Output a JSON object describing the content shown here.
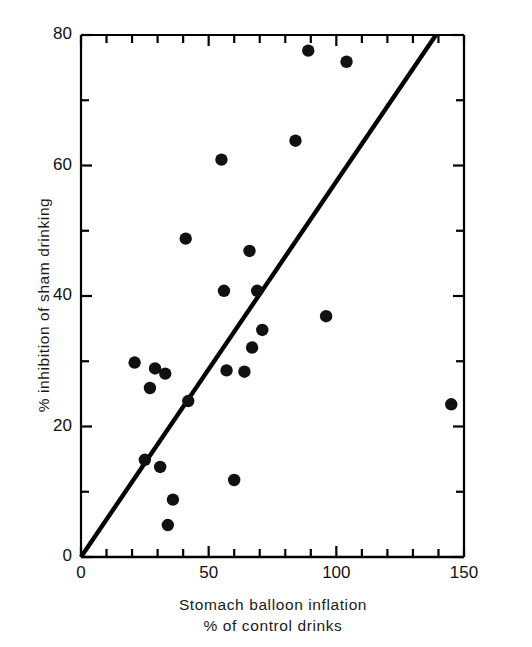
{
  "chart_data": {
    "type": "scatter",
    "title": "",
    "xlabel": "Stomach balloon inflation\n% of control drinks",
    "xlabel_line1": "Stomach balloon inflation",
    "xlabel_line2": "% of control drinks",
    "ylabel": "% inhibition of sham drinking",
    "xlim": [
      0,
      150
    ],
    "ylim": [
      0,
      80
    ],
    "x_major_ticks": [
      0,
      50,
      100,
      150
    ],
    "x_minor_ticks": [
      10,
      20,
      30,
      40,
      60,
      70,
      80,
      90,
      110,
      120,
      130,
      140
    ],
    "x_tick_labels": [
      "0",
      "50",
      "100",
      "150"
    ],
    "y_major_ticks": [
      0,
      20,
      40,
      60,
      80
    ],
    "y_minor_ticks": [
      10,
      30,
      50,
      70
    ],
    "y_tick_labels": [
      "0",
      "20",
      "40",
      "60",
      "80"
    ],
    "grid": false,
    "legend": null,
    "marker_color": "#111111",
    "line_color": "#000000",
    "points": [
      {
        "x": 21,
        "y": 29.8
      },
      {
        "x": 25,
        "y": 14.9
      },
      {
        "x": 27,
        "y": 25.9
      },
      {
        "x": 29,
        "y": 28.9
      },
      {
        "x": 31,
        "y": 13.8
      },
      {
        "x": 33,
        "y": 28.1
      },
      {
        "x": 34,
        "y": 4.9
      },
      {
        "x": 36,
        "y": 8.8
      },
      {
        "x": 41,
        "y": 48.8
      },
      {
        "x": 42,
        "y": 23.9
      },
      {
        "x": 55,
        "y": 60.9
      },
      {
        "x": 56,
        "y": 40.8
      },
      {
        "x": 57,
        "y": 28.6
      },
      {
        "x": 60,
        "y": 11.8
      },
      {
        "x": 64,
        "y": 28.4
      },
      {
        "x": 66,
        "y": 46.9
      },
      {
        "x": 67,
        "y": 32.1
      },
      {
        "x": 69,
        "y": 40.8
      },
      {
        "x": 71,
        "y": 34.8
      },
      {
        "x": 84,
        "y": 63.8
      },
      {
        "x": 89,
        "y": 77.6
      },
      {
        "x": 96,
        "y": 36.9
      },
      {
        "x": 104,
        "y": 75.9
      },
      {
        "x": 145,
        "y": 23.4
      }
    ],
    "fit_line": {
      "x_start": 0,
      "y_start": 0,
      "x_end": 139,
      "y_end": 80
    }
  },
  "axes": {
    "y_ticks": [
      {
        "value": 80,
        "label": "80"
      },
      {
        "value": 60,
        "label": "60"
      },
      {
        "value": 40,
        "label": "40"
      },
      {
        "value": 20,
        "label": "20"
      },
      {
        "value": 0,
        "label": "0"
      }
    ],
    "x_ticks": [
      {
        "value": 0,
        "label": "0"
      },
      {
        "value": 50,
        "label": "50"
      },
      {
        "value": 100,
        "label": "100"
      },
      {
        "value": 150,
        "label": "150"
      }
    ]
  },
  "labels": {
    "y_axis_title": "% inhibition of sham drinking",
    "x_axis_title_line1": "Stomach balloon inflation",
    "x_axis_title_line2": "% of control drinks"
  }
}
